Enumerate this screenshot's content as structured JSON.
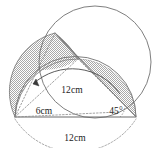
{
  "figure": {
    "type": "geometry-diagram",
    "background_color": "#ffffff",
    "stroke_color": "#555555",
    "shade_color": "#b5b5b5",
    "labels": {
      "diameter_inner": "12cm",
      "radius_left": "6cm",
      "angle_right": "45°",
      "diameter_base": "12cm"
    },
    "geometry": {
      "base_left_vertex": [
        15,
        117
      ],
      "base_right_vertex": [
        136,
        117
      ],
      "apex_point": [
        55,
        33
      ],
      "mid_point": [
        78,
        59
      ],
      "big_circle": {
        "cx": 95,
        "cy": 62,
        "r": 56
      },
      "semicircle": {
        "cx": 75,
        "cy": 117,
        "r": 60
      },
      "arc_measure_label_anchor": [
        88,
        88
      ],
      "angle_marker_vertex": [
        136,
        117
      ]
    },
    "shaded_regions": [
      {
        "name": "left-crescent",
        "pattern": "stipple"
      },
      {
        "name": "right-crescent",
        "pattern": "stipple"
      }
    ]
  }
}
